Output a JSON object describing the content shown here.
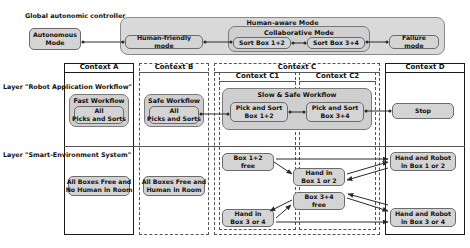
{
  "diagram": {
    "title_global_controller": "Global autonomic controller",
    "layer_robot": "Layer \"Robot Application Workflow\"",
    "layer_smart_env": "Layer \"Smart-Environment System\""
  },
  "controller": {
    "autonomous_mode": "Autonomous\nMode",
    "human_aware_mode_title": "Human-aware Mode",
    "human_friendly_mode": "Human-friendly mode",
    "collaborative_mode_title": "Collaborative Mode",
    "sort_box_12": "Sort Box 1+2",
    "sort_box_34": "Sort Box 3+4",
    "failure_mode": "Failure mode"
  },
  "contexts": {
    "a": "Context  A",
    "b": "Context  B",
    "c": "Context  C",
    "c1": "Context C1",
    "c2": "Context C2",
    "d": "Context  D"
  },
  "robot_layer": {
    "fast_workflow_title": "Fast Workflow",
    "fast_workflow_child": "All\nPicks and Sorts",
    "safe_workflow_title": "Safe Workflow",
    "safe_workflow_child": "All\nPicks and Sorts",
    "slow_safe_workflow_title": "Slow & Safe Workflow",
    "pick_sort_12": "Pick and Sort\nBox 1+2",
    "pick_sort_34": "Pick and Sort\nBox 3+4",
    "stop": "Stop"
  },
  "smart_env_layer": {
    "all_boxes_free_no_human": "All Boxes Free and\nNo Human in Room",
    "all_boxes_free_human": "All Boxes Free and\nHuman in Room",
    "box_12_free": "Box 1+2\nfree",
    "hand_in_box_1_or_2": "Hand in\nBox 1 or 2",
    "box_34_free": "Box 3+4\nfree",
    "hand_in_box_3_or_4": "Hand in\nBox 3 or 4",
    "hand_robot_box_1_or_2": "Hand and Robot\nin Box 1 or 2",
    "hand_robot_box_3_or_4": "Hand and Robot\nin Box 3 or 4"
  },
  "colors": {
    "node_fill": "#d4d4d4",
    "group_fill": "#cfcfcf",
    "wrap_fill": "#d9d9d9",
    "stroke": "#6b6b6b",
    "context_solid": "#1a1a1a",
    "context_dashed": "#555555"
  }
}
